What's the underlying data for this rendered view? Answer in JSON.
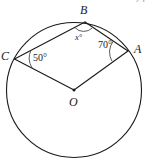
{
  "figure": {
    "type": "circle-geometry-diagram",
    "stroke_color": "#1a1a1a",
    "background_color": "#ffffff",
    "page_mark": "25",
    "points": [
      {
        "id": "A",
        "label": "A",
        "x": 128,
        "y": 51,
        "on_circle": true
      },
      {
        "id": "B",
        "label": "B",
        "x": 85,
        "y": 22,
        "on_circle": true
      },
      {
        "id": "C",
        "label": "C",
        "x": 14,
        "y": 59,
        "on_circle": true
      },
      {
        "id": "O",
        "label": "O",
        "x": 74,
        "y": 90,
        "on_circle": false
      }
    ],
    "circle": {
      "cx": 74,
      "cy": 90,
      "r": 68
    },
    "segments": [
      {
        "from": "C",
        "to": "B"
      },
      {
        "from": "B",
        "to": "A"
      },
      {
        "from": "A",
        "to": "O"
      },
      {
        "from": "O",
        "to": "C"
      }
    ],
    "angles": [
      {
        "id": "x",
        "vertex": "B",
        "label": "x°",
        "value": null,
        "style": "italic-variable"
      },
      {
        "id": "a70",
        "vertex": "A",
        "label": "70°",
        "value": 70,
        "style": "numeric"
      },
      {
        "id": "a50",
        "vertex": "C",
        "label": "50°",
        "value": 50,
        "style": "numeric"
      }
    ]
  }
}
